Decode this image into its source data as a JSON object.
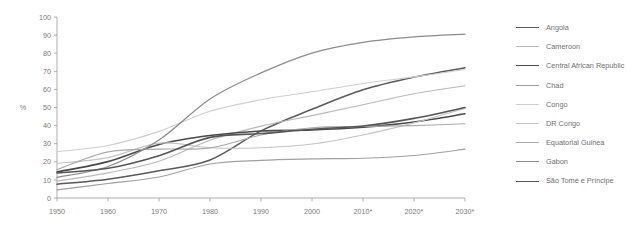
{
  "chart_data": {
    "type": "line",
    "title": "",
    "subtitle": "",
    "xlabel": "",
    "ylabel": "%",
    "ylim": [
      0,
      100
    ],
    "ytick_step": 10,
    "yticks": [
      0,
      10,
      20,
      30,
      40,
      50,
      60,
      70,
      80,
      90,
      100
    ],
    "x": [
      1950,
      1960,
      1970,
      1980,
      1990,
      2000,
      2010,
      2020,
      2030
    ],
    "xtick_labels": [
      "1950",
      "1960",
      "1970",
      "1980",
      "1990",
      "2000",
      "2010*",
      "2020*",
      "2030*"
    ],
    "grid": false,
    "legend_position": "right",
    "annotation": "* projected values",
    "series": [
      {
        "name": "Angola",
        "color": "#5a5a5a",
        "width": 1.5,
        "values": [
          7.6,
          10.4,
          15.0,
          21.0,
          37.1,
          49.0,
          59.8,
          66.8,
          72.0
        ]
      },
      {
        "name": "Cameroon",
        "color": "#b9b9b9",
        "width": 1.1,
        "values": [
          9.3,
          13.9,
          20.3,
          31.9,
          39.7,
          45.5,
          51.5,
          57.6,
          62.0
        ]
      },
      {
        "name": "Central African Republic",
        "color": "#4a4a4a",
        "width": 1.6,
        "values": [
          14.4,
          20.1,
          29.6,
          34.5,
          37.0,
          37.6,
          39.1,
          42.0,
          46.5
        ]
      },
      {
        "name": "Chad",
        "color": "#a0a0a0",
        "width": 1.1,
        "values": [
          4.5,
          8.0,
          11.6,
          18.8,
          20.8,
          21.6,
          22.0,
          23.5,
          27.0
        ]
      },
      {
        "name": "Congo",
        "color": "#cfcfcf",
        "width": 1.1,
        "values": [
          25.6,
          29.0,
          36.8,
          47.9,
          54.3,
          58.7,
          63.3,
          66.9,
          71.0
        ]
      },
      {
        "name": "DR Congo",
        "color": "#c4c4c4",
        "width": 1.1,
        "values": [
          19.1,
          22.3,
          30.3,
          27.8,
          27.8,
          29.8,
          34.8,
          41.5,
          49.5
        ]
      },
      {
        "name": "Equatorial Guinea",
        "color": "#ababab",
        "width": 1.1,
        "values": [
          15.7,
          25.5,
          27.0,
          27.7,
          34.8,
          38.8,
          39.5,
          40.0,
          41.0
        ]
      },
      {
        "name": "Gabon",
        "color": "#8c8c8c",
        "width": 1.3,
        "values": [
          11.4,
          17.4,
          32.0,
          54.7,
          69.1,
          80.1,
          86.0,
          89.0,
          90.5
        ]
      },
      {
        "name": "São Tomé e Príncipe",
        "color": "#555555",
        "width": 1.6,
        "values": [
          13.8,
          16.4,
          23.4,
          33.5,
          35.6,
          38.0,
          39.8,
          44.0,
          50.0
        ]
      }
    ]
  },
  "legend": {
    "items": [
      {
        "label": "Angola"
      },
      {
        "label": "Cameroon"
      },
      {
        "label": "Central African Republic"
      },
      {
        "label": "Chad"
      },
      {
        "label": "Congo"
      },
      {
        "label": "DR Congo"
      },
      {
        "label": "Equatorial Guinea"
      },
      {
        "label": "Gabon"
      },
      {
        "label": "São Tomé e Príncipe"
      }
    ]
  }
}
